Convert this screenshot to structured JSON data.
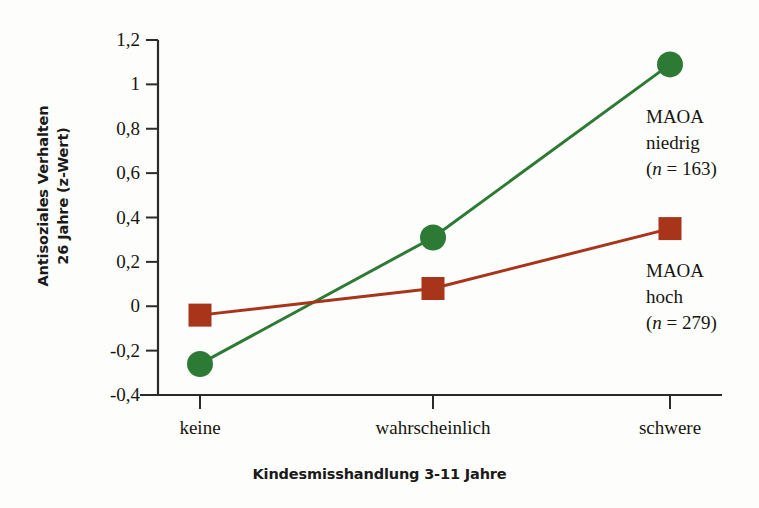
{
  "chart_data": {
    "type": "line",
    "title": "",
    "xlabel": "Kindesmisshandlung 3-11 Jahre",
    "ylabel": "Antisoziales Verhalten 26 Jahre (z-Wert)",
    "categories": [
      "keine",
      "wahrscheinlich",
      "schwere"
    ],
    "series": [
      {
        "name": "MAOA niedrig",
        "n": 163,
        "color": "#2d7a35",
        "marker": "circle",
        "values": [
          -0.26,
          0.31,
          1.09
        ]
      },
      {
        "name": "MAOA hoch",
        "n": 279,
        "color": "#a8341a",
        "marker": "square",
        "values": [
          -0.04,
          0.08,
          0.35
        ]
      }
    ],
    "ylim": [
      -0.4,
      1.2
    ],
    "yticks": [
      -0.4,
      -0.2,
      0,
      0.2,
      0.4,
      0.6,
      0.8,
      1,
      1.2
    ],
    "ytick_labels": [
      "-0,4",
      "-0,2",
      "0",
      "0,2",
      "0,4",
      "0,6",
      "0,8",
      "1",
      "1,2"
    ],
    "grid": false,
    "legend_position": "right-inline"
  },
  "axes": {
    "y_title_line1": "Antisoziales Verhalten",
    "y_title_line2": "26 Jahre (z-Wert)",
    "x_title": "Kindesmisshandlung 3-11 Jahre"
  },
  "legend": {
    "items": [
      {
        "line1": "MAOA",
        "line2": "niedrig",
        "line3_prefix": "(",
        "line3_n": "n",
        "line3_suffix": " = 163)"
      },
      {
        "line1": "MAOA",
        "line2": "hoch",
        "line3_prefix": "(",
        "line3_n": "n",
        "line3_suffix": " = 279)"
      }
    ]
  },
  "colors": {
    "series_low": "#2d7a35",
    "series_high": "#a8341a",
    "axis": "#2b2b2b",
    "text": "#16160f",
    "background": "#fdfdfb"
  }
}
